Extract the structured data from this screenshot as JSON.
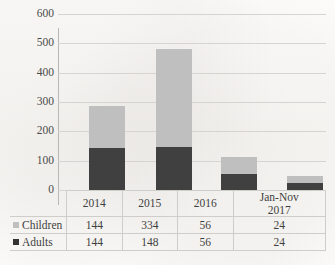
{
  "chart_data": {
    "type": "bar",
    "subtype": "stacked-bar",
    "title": "",
    "xlabel": "",
    "ylabel": "",
    "ylim": [
      0,
      600
    ],
    "yticks": [
      0,
      100,
      200,
      300,
      400,
      500,
      600
    ],
    "ytick_labels": [
      "0",
      "100",
      "200",
      "300",
      "400",
      "500",
      "600"
    ],
    "grid": true,
    "legend_position": "table-left-column",
    "categories": [
      "2014",
      "2015",
      "2016",
      "Jan-Nov 2017"
    ],
    "series": [
      {
        "name": "Adults",
        "values": [
          144,
          148,
          56,
          24
        ],
        "color": "#404040"
      },
      {
        "name": "Children",
        "values": [
          144,
          334,
          56,
          24
        ],
        "color": "#bfbfbf"
      }
    ],
    "totals": [
      288,
      482,
      112,
      48
    ]
  },
  "title_remnant": "",
  "axis": {
    "ticks": [
      {
        "label": "600",
        "value": 600
      },
      {
        "label": "500",
        "value": 500
      },
      {
        "label": "400",
        "value": 400
      },
      {
        "label": "300",
        "value": 300
      },
      {
        "label": "200",
        "value": 200
      },
      {
        "label": "100",
        "value": 100
      },
      {
        "label": "0",
        "value": 0
      }
    ]
  },
  "table": {
    "header": {
      "corner": "",
      "columns": [
        {
          "line1": "2014",
          "line2": ""
        },
        {
          "line1": "2015",
          "line2": ""
        },
        {
          "line1": "2016",
          "line2": ""
        },
        {
          "line1": "Jan-Nov",
          "line2": "2017"
        }
      ]
    },
    "rows": [
      {
        "label": "Children",
        "swatch_color": "#bfbfbf",
        "values": [
          "144",
          "334",
          "56",
          "24"
        ]
      },
      {
        "label": "Adults",
        "swatch_color": "#333333",
        "values": [
          "144",
          "148",
          "56",
          "24"
        ]
      }
    ]
  },
  "colors": {
    "children": "#bfbfbf",
    "adults": "#404040",
    "gridline": "#d6d4d1",
    "axis": "#b9b7b4",
    "table_border": "#cfcdca",
    "background": "#fbfaf8"
  }
}
